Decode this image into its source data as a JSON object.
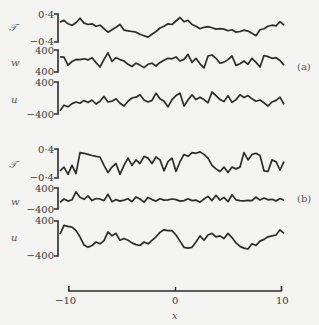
{
  "chart_data": {
    "type": "line",
    "title": "",
    "xlabel": "x",
    "xlim": [
      -10,
      10
    ],
    "xticks": [
      -10,
      0,
      10
    ],
    "xtick_labels": [
      "−10",
      "0",
      "10"
    ],
    "grid": false,
    "legend": null,
    "panels": [
      {
        "label": "(a)",
        "series": [
          {
            "name": "T",
            "ylabel": "𝒯",
            "ylim": [
              -0.4,
              0.4
            ],
            "ytick_labels": [
              "0·4",
              "−0·4"
            ],
            "values": [
              0.17,
              0.22,
              0.12,
              0.08,
              0.15,
              0.28,
              0.14,
              0.1,
              0.12,
              0.05,
              0.08,
              -0.02,
              -0.12,
              -0.05,
              0.02,
              0.1,
              -0.06,
              -0.08,
              -0.1,
              -0.12,
              -0.18,
              -0.22,
              -0.26,
              -0.18,
              -0.1,
              0.0,
              0.05,
              0.12,
              0.1,
              0.2,
              0.3,
              0.18,
              0.22,
              0.1,
              0.05,
              -0.02,
              0.02,
              0.04,
              0.01,
              -0.03,
              -0.02,
              -0.03,
              -0.08,
              -0.05,
              -0.12,
              -0.1,
              -0.06,
              -0.09,
              -0.15,
              -0.22,
              -0.05,
              -0.02,
              0.05,
              0.08,
              0.06,
              0.18,
              0.08
            ]
          },
          {
            "name": "w",
            "ylabel": "w",
            "ylim": [
              -400,
              400
            ],
            "ytick_labels": [
              "400",
              "400"
            ],
            "values": [
              150,
              140,
              -150,
              -20,
              60,
              50,
              80,
              40,
              120,
              -60,
              -220,
              60,
              300,
              -20,
              120,
              50,
              0,
              -120,
              -200,
              -80,
              -150,
              -240,
              -120,
              -80,
              -180,
              -50,
              30,
              100,
              80,
              150,
              0,
              60,
              240,
              -50,
              100,
              -100,
              -250,
              180,
              220,
              100,
              -80,
              -40,
              50,
              180,
              -160,
              -100,
              0,
              -120,
              100,
              -50,
              -220,
              200,
              160,
              100,
              120,
              20,
              -150
            ]
          },
          {
            "name": "u",
            "ylabel": "u",
            "ylim": [
              -400,
              400
            ],
            "ytick_labels": [
              "400",
              "−400"
            ],
            "values": [
              -320,
              -180,
              -220,
              -140,
              -100,
              -130,
              -60,
              -110,
              -50,
              -150,
              -80,
              40,
              -100,
              -80,
              -20,
              -130,
              -200,
              -80,
              0,
              20,
              80,
              -50,
              -100,
              -60,
              120,
              -20,
              -80,
              -220,
              -40,
              60,
              120,
              -200,
              -50,
              80,
              -40,
              20,
              -40,
              -120,
              150,
              60,
              -40,
              -90,
              60,
              -110,
              -40,
              80,
              10,
              60,
              -20,
              -80,
              -50,
              -120,
              -200,
              -100,
              -60,
              20,
              -160
            ]
          }
        ]
      },
      {
        "label": "(b)",
        "series": [
          {
            "name": "T",
            "ylabel": "𝒯",
            "ylim": [
              -0.4,
              0.4
            ],
            "ytick_labels": [
              "0·4",
              "−0·4"
            ],
            "values": [
              -0.2,
              -0.1,
              -0.3,
              -0.05,
              -0.28,
              0.3,
              0.28,
              0.25,
              0.22,
              0.2,
              0.18,
              -0.05,
              -0.25,
              -0.1,
              0.0,
              -0.3,
              -0.05,
              0.15,
              -0.05,
              0.1,
              0.0,
              0.2,
              0.15,
              0.0,
              0.18,
              0.1,
              -0.2,
              0.05,
              0.15,
              -0.22,
              0.05,
              0.25,
              0.2,
              0.3,
              0.28,
              0.32,
              0.25,
              0.15,
              -0.05,
              -0.15,
              -0.22,
              -0.1,
              -0.25,
              -0.1,
              -0.15,
              -0.1,
              0.3,
              0.1,
              0.25,
              0.28,
              0.22,
              -0.2,
              -0.22,
              0.1,
              0.05,
              -0.18,
              0.05
            ]
          },
          {
            "name": "w",
            "ylabel": "w",
            "ylim": [
              -400,
              400
            ],
            "ytick_labels": [
              "400",
              "−400"
            ],
            "values": [
              -150,
              -20,
              -100,
              -50,
              250,
              50,
              -30,
              100,
              -80,
              0,
              -20,
              -80,
              160,
              -120,
              -40,
              -100,
              -60,
              -10,
              -120,
              60,
              -20,
              -140,
              40,
              -40,
              -100,
              -10,
              -60,
              -50,
              -20,
              -40,
              -100,
              -80,
              -10,
              -80,
              -60,
              -140,
              -20,
              80,
              -80,
              120,
              -60,
              40,
              -120,
              140,
              -50,
              -80,
              -90,
              -70,
              -80,
              50,
              -60,
              20,
              -50,
              -30,
              -90,
              0,
              -70
            ]
          },
          {
            "name": "u",
            "ylabel": "u",
            "ylim": [
              -400,
              400
            ],
            "ytick_labels": [
              "400",
              "−400"
            ],
            "values": [
              100,
              300,
              280,
              260,
              180,
              40,
              -150,
              -200,
              -160,
              -80,
              -120,
              -50,
              150,
              60,
              120,
              -40,
              0,
              -40,
              -100,
              -140,
              -160,
              -80,
              -120,
              -40,
              40,
              140,
              200,
              180,
              180,
              80,
              -60,
              -200,
              -220,
              -200,
              -80,
              60,
              -40,
              80,
              120,
              40,
              60,
              0,
              120,
              20,
              -100,
              -180,
              -220,
              -240,
              -120,
              -160,
              -60,
              -20,
              40,
              60,
              80,
              200,
              120
            ]
          }
        ]
      }
    ]
  }
}
